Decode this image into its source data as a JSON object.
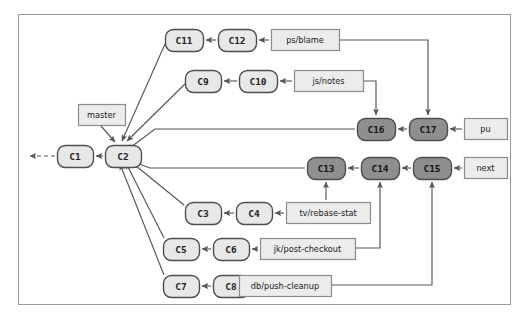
{
  "figure": {
    "caption": "",
    "frame": {
      "x": 18,
      "y": 14,
      "w": 493,
      "h": 291,
      "border_color": "#9a9a9a",
      "background": "#ffffff"
    }
  },
  "colors": {
    "commit_light_fill": "#e8e8e8",
    "commit_dark_fill": "#8f8f8f",
    "commit_stroke": "#4d4d4d",
    "label_fill": "#ececec",
    "label_stroke": "#8c8c8c",
    "edge_color": "#555555",
    "text_dark": "#222222",
    "text_light": "#1a1a1a"
  },
  "commits": [
    {
      "id": "c1",
      "label": "C1",
      "x": 57,
      "y": 145,
      "w": 36,
      "h": 22,
      "shade": "light"
    },
    {
      "id": "c2",
      "label": "C2",
      "x": 105,
      "y": 145,
      "w": 36,
      "h": 22,
      "shade": "light"
    },
    {
      "id": "c3",
      "label": "C3",
      "x": 185,
      "y": 202,
      "w": 36,
      "h": 22,
      "shade": "light"
    },
    {
      "id": "c4",
      "label": "C4",
      "x": 236,
      "y": 202,
      "w": 36,
      "h": 22,
      "shade": "light"
    },
    {
      "id": "c5",
      "label": "C5",
      "x": 163,
      "y": 238,
      "w": 36,
      "h": 22,
      "shade": "light"
    },
    {
      "id": "c6",
      "label": "C6",
      "x": 213,
      "y": 238,
      "w": 36,
      "h": 22,
      "shade": "light"
    },
    {
      "id": "c7",
      "label": "C7",
      "x": 163,
      "y": 275,
      "w": 36,
      "h": 22,
      "shade": "light"
    },
    {
      "id": "c8",
      "label": "C8",
      "x": 213,
      "y": 275,
      "w": 36,
      "h": 22,
      "shade": "light"
    },
    {
      "id": "c9",
      "label": "C9",
      "x": 185,
      "y": 70,
      "w": 36,
      "h": 22,
      "shade": "light"
    },
    {
      "id": "c10",
      "label": "C10",
      "x": 239,
      "y": 70,
      "w": 38,
      "h": 22,
      "shade": "light"
    },
    {
      "id": "c11",
      "label": "C11",
      "x": 165,
      "y": 29,
      "w": 38,
      "h": 22,
      "shade": "light"
    },
    {
      "id": "c12",
      "label": "C12",
      "x": 218,
      "y": 29,
      "w": 38,
      "h": 22,
      "shade": "light"
    },
    {
      "id": "c13",
      "label": "C13",
      "x": 307,
      "y": 157,
      "w": 38,
      "h": 22,
      "shade": "dark"
    },
    {
      "id": "c14",
      "label": "C14",
      "x": 361,
      "y": 157,
      "w": 38,
      "h": 22,
      "shade": "dark"
    },
    {
      "id": "c15",
      "label": "C15",
      "x": 413,
      "y": 157,
      "w": 38,
      "h": 22,
      "shade": "dark"
    },
    {
      "id": "c16",
      "label": "C16",
      "x": 357,
      "y": 118,
      "w": 38,
      "h": 22,
      "shade": "dark"
    },
    {
      "id": "c17",
      "label": "C17",
      "x": 409,
      "y": 118,
      "w": 38,
      "h": 22,
      "shade": "dark"
    }
  ],
  "branch_labels": [
    {
      "id": "master",
      "label": "master",
      "x": 78,
      "y": 104,
      "w": 47,
      "h": 21
    },
    {
      "id": "ps-blame",
      "label": "ps/blame",
      "x": 271,
      "y": 29,
      "w": 68,
      "h": 21
    },
    {
      "id": "js-notes",
      "label": "js/notes",
      "x": 294,
      "y": 70,
      "w": 69,
      "h": 21
    },
    {
      "id": "pu",
      "label": "pu",
      "x": 464,
      "y": 118,
      "w": 43,
      "h": 21
    },
    {
      "id": "next",
      "label": "next",
      "x": 464,
      "y": 157,
      "w": 43,
      "h": 21
    },
    {
      "id": "tv-rebase-stat",
      "label": "tv/rebase-stat",
      "x": 286,
      "y": 202,
      "w": 84,
      "h": 21
    },
    {
      "id": "jk-post-checkout",
      "label": "jk/post-checkout",
      "x": 260,
      "y": 238,
      "w": 95,
      "h": 21
    },
    {
      "id": "db-push-cleanup",
      "label": "db/push-cleanup",
      "x": 239,
      "y": 275,
      "w": 92,
      "h": 21
    }
  ],
  "edges": [
    {
      "from": "c1",
      "to": "outside",
      "style": "dashed",
      "kind": "straight"
    },
    {
      "from": "c2",
      "to": "c1",
      "style": "solid",
      "kind": "straight"
    },
    {
      "from": "c11",
      "to": "c2",
      "style": "solid",
      "kind": "diagonal"
    },
    {
      "from": "c9",
      "to": "c2",
      "style": "solid",
      "kind": "diagonal"
    },
    {
      "from": "c12",
      "to": "c11",
      "style": "solid",
      "kind": "straight"
    },
    {
      "from": "c10",
      "to": "c9",
      "style": "solid",
      "kind": "straight"
    },
    {
      "from": "ps-blame",
      "to": "c12",
      "style": "solid",
      "kind": "straight"
    },
    {
      "from": "js-notes",
      "to": "c10",
      "style": "solid",
      "kind": "straight"
    },
    {
      "from": "ps-blame",
      "to": "c17",
      "style": "solid",
      "kind": "orthogonal"
    },
    {
      "from": "js-notes",
      "to": "c16",
      "style": "solid",
      "kind": "orthogonal"
    },
    {
      "from": "pu",
      "to": "c17",
      "style": "solid",
      "kind": "straight"
    },
    {
      "from": "c17",
      "to": "c16",
      "style": "solid",
      "kind": "straight"
    },
    {
      "from": "c16",
      "to": "c2",
      "style": "solid",
      "kind": "orthogonal"
    },
    {
      "from": "next",
      "to": "c15",
      "style": "solid",
      "kind": "straight"
    },
    {
      "from": "c15",
      "to": "c14",
      "style": "solid",
      "kind": "straight"
    },
    {
      "from": "c14",
      "to": "c13",
      "style": "solid",
      "kind": "straight"
    },
    {
      "from": "c13",
      "to": "c2",
      "style": "solid",
      "kind": "orthogonal"
    },
    {
      "from": "tv-rebase-stat",
      "to": "c13",
      "style": "solid",
      "kind": "orthogonal"
    },
    {
      "from": "jk-post-checkout",
      "to": "c14",
      "style": "solid",
      "kind": "orthogonal"
    },
    {
      "from": "db-push-cleanup",
      "to": "c15",
      "style": "solid",
      "kind": "orthogonal"
    },
    {
      "from": "c4",
      "to": "c3",
      "style": "solid",
      "kind": "straight"
    },
    {
      "from": "c3",
      "to": "c2",
      "style": "solid",
      "kind": "diagonal"
    },
    {
      "from": "tv-rebase-stat",
      "to": "c4",
      "style": "solid",
      "kind": "straight"
    },
    {
      "from": "c6",
      "to": "c5",
      "style": "solid",
      "kind": "straight"
    },
    {
      "from": "c5",
      "to": "c2",
      "style": "solid",
      "kind": "diagonal"
    },
    {
      "from": "jk-post-checkout",
      "to": "c6",
      "style": "solid",
      "kind": "straight"
    },
    {
      "from": "c8",
      "to": "c7",
      "style": "solid",
      "kind": "straight"
    },
    {
      "from": "c7",
      "to": "c2",
      "style": "solid",
      "kind": "diagonal"
    },
    {
      "from": "db-push-cleanup",
      "to": "c8",
      "style": "solid",
      "kind": "straight"
    }
  ]
}
